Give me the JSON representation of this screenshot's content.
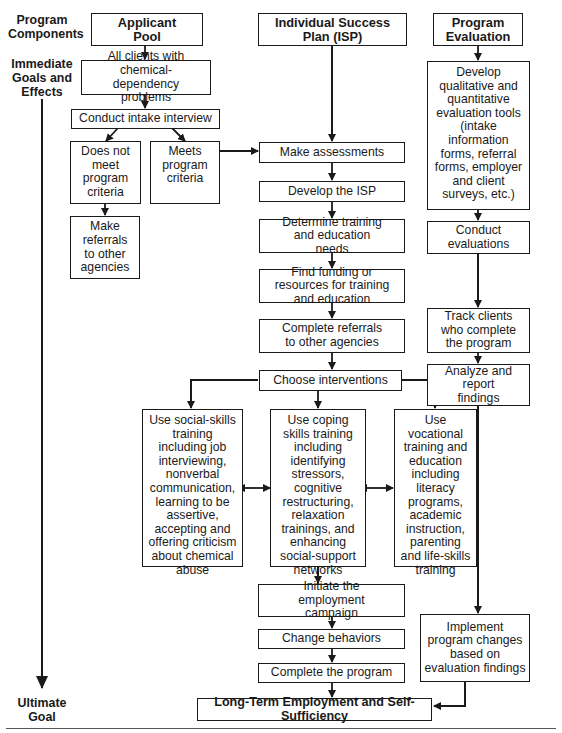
{
  "side_labels": {
    "program_components": "Program Components",
    "immediate_goals": "Immediate Goals and Effects",
    "ultimate_goal": "Ultimate Goal"
  },
  "columns": {
    "applicant_pool": "Applicant Pool",
    "isp": "Individual Success Plan (ISP)",
    "program_evaluation": "Program Evaluation"
  },
  "applicant_steps": {
    "all_clients": "All clients with chemical-dependency problems",
    "intake": "Conduct intake interview",
    "does_not_meet": "Does not meet program criteria",
    "meets": "Meets program criteria",
    "referrals": "Make referrals to other agencies"
  },
  "isp_steps": {
    "assessments": "Make assessments",
    "develop_isp": "Develop the ISP",
    "determine_needs": "Determine training and education needs",
    "find_funding": "Find funding or resources for training and education",
    "complete_referrals": "Complete referrals to other agencies",
    "choose_interventions": "Choose interventions",
    "initiate_campaign": "Initiate the employment campaign",
    "change_behaviors": "Change behaviors",
    "complete_program": "Complete the program"
  },
  "interventions": {
    "social_skills": "Use social-skills training including job interviewing, nonverbal communication, learning to be assertive, accepting and offering criticism about chemical abuse",
    "coping_skills": "Use coping skills training including identifying stressors, cognitive restructuring, relaxation trainings, and enhancing social-support networks",
    "vocational": "Use vocational training and education including literacy programs, academic instruction, parenting and life-skills training"
  },
  "evaluation_steps": {
    "develop_tools": "Develop qualitative and quantitative evaluation tools (intake information forms, referral forms, employer and client surveys, etc.)",
    "conduct": "Conduct evaluations",
    "track": "Track clients who complete the program",
    "analyze": "Analyze and report findings",
    "implement": "Implement program changes based on evaluation findings"
  },
  "final_goal": "Long-Term Employment and Self-Sufficiency"
}
